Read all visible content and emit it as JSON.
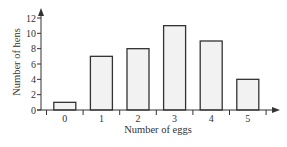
{
  "chart_data": {
    "type": "bar",
    "title": "",
    "xlabel": "Number of eggs",
    "ylabel": "Number of hens",
    "categories": [
      "0",
      "1",
      "2",
      "3",
      "4",
      "5"
    ],
    "values": [
      1,
      7,
      8,
      11,
      9,
      4
    ],
    "ylim": [
      0,
      12
    ],
    "yticks": [
      "0",
      "2",
      "4",
      "6",
      "8",
      "10",
      "12"
    ],
    "grid": false,
    "legend": "none",
    "colors": {
      "bar_fill": "#f2f2f2",
      "bar_stroke": "#333333",
      "axis": "#333333"
    }
  }
}
